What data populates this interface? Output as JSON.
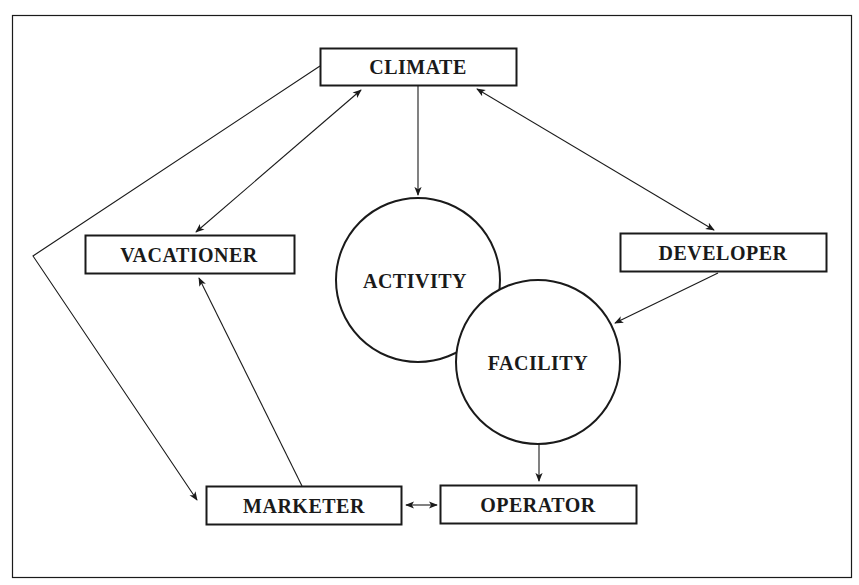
{
  "diagram": {
    "type": "flow-relationship",
    "colors": {
      "stroke": "#1a1a1a",
      "background": "#ffffff",
      "text": "#1a1a1a"
    },
    "boxes": {
      "climate": "CLIMATE",
      "vacationer": "VACATIONER",
      "developer": "DEVELOPER",
      "marketer": "MARKETER",
      "operator": "OPERATOR"
    },
    "circles": {
      "activity": "ACTIVITY",
      "facility": "FACILITY"
    },
    "edges": [
      {
        "from": "CLIMATE",
        "to": "VACATIONER",
        "direction": "bidirectional"
      },
      {
        "from": "CLIMATE",
        "to": "DEVELOPER",
        "direction": "bidirectional"
      },
      {
        "from": "CLIMATE",
        "to": "ACTIVITY",
        "direction": "forward"
      },
      {
        "from": "CLIMATE",
        "to": "MARKETER",
        "direction": "forward",
        "route": "via left bend"
      },
      {
        "from": "MARKETER",
        "to": "VACATIONER",
        "direction": "forward"
      },
      {
        "from": "DEVELOPER",
        "to": "FACILITY",
        "direction": "forward"
      },
      {
        "from": "FACILITY",
        "to": "OPERATOR",
        "direction": "forward"
      },
      {
        "from": "MARKETER",
        "to": "OPERATOR",
        "direction": "bidirectional"
      }
    ]
  }
}
